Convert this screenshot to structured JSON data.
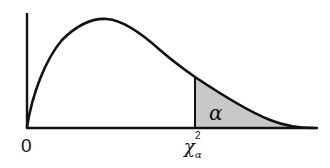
{
  "figure": {
    "labels": {
      "origin": "0",
      "critical_value_base": "χ",
      "critical_value_sup": "2",
      "critical_value_sub": "α",
      "area": "α"
    },
    "colors": {
      "curve": "#111111",
      "axes": "#111111",
      "shade": "#c8c8c8",
      "background": "#ffffff"
    }
  }
}
